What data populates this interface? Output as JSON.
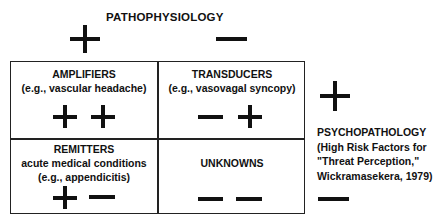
{
  "top_axis": {
    "label": "PATHOPHYSIOLOGY",
    "left_sign": "plus",
    "right_sign": "minus"
  },
  "side_axis": {
    "label_lines": [
      "PSYCHOPATHOLOGY",
      "(High Risk Factors for",
      "\"Threat Perception,\"",
      "Wickramasekera, 1979)"
    ],
    "top_sign": "plus",
    "bottom_sign": "minus"
  },
  "cells": [
    {
      "title": "AMPLIFIERS",
      "lines": [
        "(e.g., vascular headache)"
      ],
      "signs": [
        "plus",
        "plus"
      ]
    },
    {
      "title": "TRANSDUCERS",
      "lines": [
        "(e.g., vasovagal syncopy)"
      ],
      "signs": [
        "minus",
        "plus"
      ]
    },
    {
      "title": "REMITTERS",
      "lines": [
        "acute medical conditions",
        "(e.g., appendicitis)"
      ],
      "signs": [
        "plus",
        "minus"
      ]
    },
    {
      "title": "UNKNOWNS",
      "lines": [],
      "signs": [
        "minus",
        "minus"
      ]
    }
  ]
}
